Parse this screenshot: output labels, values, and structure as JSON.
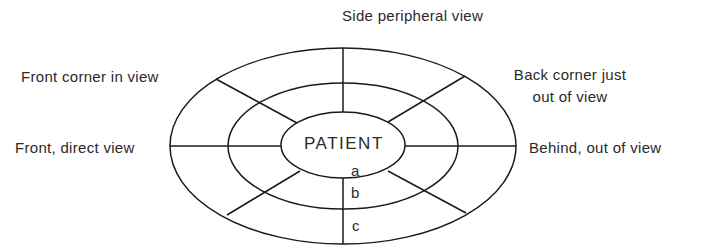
{
  "diagram": {
    "center_label": "PATIENT",
    "zones": [
      "a",
      "b",
      "c"
    ],
    "labels": {
      "top": "Side peripheral view",
      "front_corner": "Front corner in view",
      "back_corner_line1": "Back corner just",
      "back_corner_line2": "out of view",
      "front": "Front, direct view",
      "behind": "Behind, out of view"
    },
    "stroke_color": "#1a1a1a",
    "text_color": "#2a2a2a"
  }
}
